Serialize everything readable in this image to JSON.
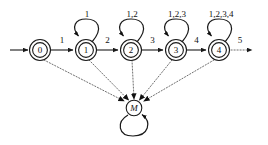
{
  "diagram": {
    "type": "finite-state-automaton",
    "title": "",
    "start_arrow": {
      "label": ""
    },
    "states": [
      {
        "id": "0",
        "label": "0",
        "cx": 40,
        "cy": 50,
        "shape": "double-circle",
        "accepting": true
      },
      {
        "id": "1",
        "label": "1",
        "cx": 86,
        "cy": 50,
        "shape": "double-circle",
        "accepting": true
      },
      {
        "id": "2",
        "label": "2",
        "cx": 131,
        "cy": 50,
        "shape": "double-circle",
        "accepting": true
      },
      {
        "id": "3",
        "label": "3",
        "cx": 176,
        "cy": 50,
        "shape": "double-circle",
        "accepting": true
      },
      {
        "id": "4",
        "label": "4",
        "cx": 219,
        "cy": 50,
        "shape": "double-circle",
        "accepting": true
      },
      {
        "id": "M",
        "label": "M",
        "cx": 134,
        "cy": 108,
        "shape": "circle",
        "accepting": false
      }
    ],
    "chain_transitions": [
      {
        "from": "0",
        "to": "1",
        "label": "1",
        "style": "solid"
      },
      {
        "from": "1",
        "to": "2",
        "label": "2",
        "style": "solid"
      },
      {
        "from": "2",
        "to": "3",
        "label": "3",
        "style": "solid"
      },
      {
        "from": "3",
        "to": "4",
        "label": "4",
        "style": "solid"
      },
      {
        "from": "4",
        "to": "next",
        "label": "5",
        "style": "dotted"
      }
    ],
    "self_loops": [
      {
        "state": "1",
        "label": "1",
        "style": "solid"
      },
      {
        "state": "2",
        "label": "1,2",
        "style": "solid"
      },
      {
        "state": "3",
        "label": "1,2,3",
        "style": "solid"
      },
      {
        "state": "4",
        "label": "1,2,3,4",
        "style": "solid"
      },
      {
        "state": "M",
        "label": "",
        "style": "solid"
      }
    ],
    "sink_transitions": [
      {
        "from": "0",
        "to": "M",
        "label": "",
        "style": "dotted"
      },
      {
        "from": "1",
        "to": "M",
        "label": "",
        "style": "dotted"
      },
      {
        "from": "2",
        "to": "M",
        "label": "",
        "style": "dotted"
      },
      {
        "from": "3",
        "to": "M",
        "label": "",
        "style": "dotted"
      },
      {
        "from": "4",
        "to": "M",
        "label": "",
        "style": "dotted"
      }
    ],
    "colors": {
      "stroke": "#1a1a1a",
      "dotted_stroke": "#4a4a4a",
      "background": "#ffffff",
      "text": "#111111"
    }
  }
}
